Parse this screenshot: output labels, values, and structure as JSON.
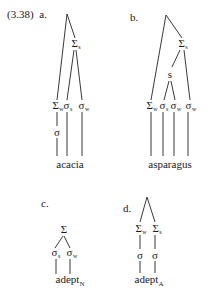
{
  "example_number": "(3.38)",
  "trees": {
    "a": {
      "label": "a.",
      "word": "acacia",
      "word_subscript": "",
      "nodes": {
        "foot_strong": {
          "symbol": "Σ",
          "sub": "s"
        },
        "foot_weak": {
          "symbol": "Σ",
          "sub": "w"
        },
        "syl_strong": {
          "symbol": "σ",
          "sub": "s"
        },
        "syl_weak": {
          "symbol": "σ",
          "sub": "w"
        },
        "syl_plain": {
          "symbol": "σ",
          "sub": ""
        }
      }
    },
    "b": {
      "label": "b.",
      "word": "asparagus",
      "word_subscript": "",
      "nodes": {
        "foot_strong": {
          "symbol": "Σ",
          "sub": "s"
        },
        "s_node": {
          "symbol": "s",
          "sub": ""
        },
        "foot_weak": {
          "symbol": "Σ",
          "sub": "w"
        },
        "syl_strong": {
          "symbol": "σ",
          "sub": "s"
        },
        "syl_weak_1": {
          "symbol": "σ",
          "sub": "w"
        },
        "syl_weak_2": {
          "symbol": "σ",
          "sub": "w"
        }
      }
    },
    "c": {
      "label": "c.",
      "word": "adept",
      "word_subscript": "N",
      "nodes": {
        "foot": {
          "symbol": "Σ",
          "sub": ""
        },
        "syl_strong": {
          "symbol": "σ",
          "sub": "s"
        },
        "syl_weak": {
          "symbol": "σ",
          "sub": "w"
        }
      }
    },
    "d": {
      "label": "d.",
      "word": "adept",
      "word_subscript": "A",
      "nodes": {
        "foot_weak": {
          "symbol": "Σ",
          "sub": "w"
        },
        "foot_strong": {
          "symbol": "Σ",
          "sub": "s"
        },
        "syl_1": {
          "symbol": "σ",
          "sub": ""
        },
        "syl_2": {
          "symbol": "σ",
          "sub": ""
        }
      }
    }
  },
  "colors": {
    "ink": "#1a1a1a",
    "background": "#ffffff"
  }
}
